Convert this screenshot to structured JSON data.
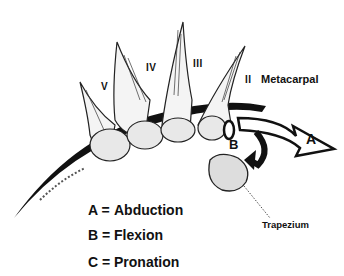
{
  "figure": {
    "labels": {
      "v": "V",
      "iv": "IV",
      "iii": "III",
      "ii": "II",
      "metacarpal": "Metacarpal",
      "trapezium": "Trapezium",
      "arrow_a": "A",
      "arrow_b": "B"
    },
    "legend": [
      {
        "key": "A =",
        "value": "Abduction"
      },
      {
        "key": "B =",
        "value": "Flexion"
      },
      {
        "key": "C =",
        "value": "Pronation"
      }
    ]
  }
}
